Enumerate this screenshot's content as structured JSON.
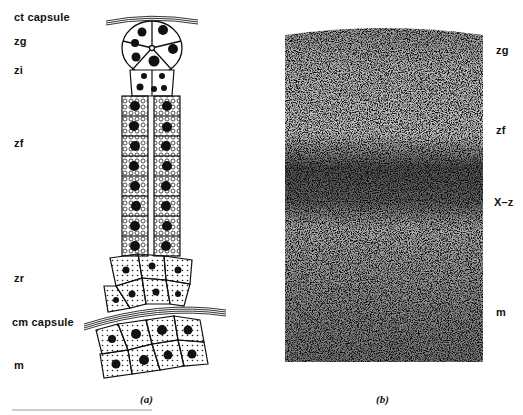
{
  "figure": {
    "panel_a": {
      "caption": "(a)",
      "labels": {
        "ct_capsule": "ct capsule",
        "zg": "zg",
        "zi": "zi",
        "zf": "zf",
        "zr": "zr",
        "cm_capsule": "cm capsule",
        "m": "m"
      }
    },
    "panel_b": {
      "caption": "(b)",
      "labels": {
        "zg": "zg",
        "zf": "zf",
        "xz": "X–z",
        "m": "m"
      }
    }
  }
}
